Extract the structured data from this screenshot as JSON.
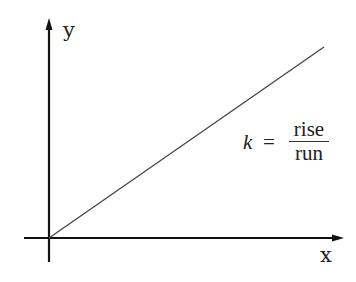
{
  "diagram": {
    "type": "linear-proportionality-graph",
    "axes": {
      "x_label": "x",
      "y_label": "y"
    },
    "line": {
      "description": "straight line through origin with positive slope",
      "from": [
        0,
        0
      ],
      "direction": "up-right"
    },
    "formula": {
      "variable": "k",
      "equals": "=",
      "numerator": "rise",
      "denominator": "run"
    },
    "colors": {
      "axes": "#111111",
      "line": "#444444",
      "text": "#222222",
      "background": "#ffffff"
    }
  }
}
